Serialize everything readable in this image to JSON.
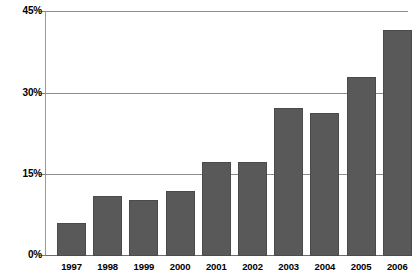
{
  "chart_data": {
    "type": "bar",
    "title": "",
    "xlabel": "",
    "ylabel": "",
    "categories": [
      "1997",
      "1998",
      "1999",
      "2000",
      "2001",
      "2002",
      "2003",
      "2004",
      "2005",
      "2006"
    ],
    "values": [
      6.1,
      11.1,
      10.2,
      12.0,
      17.2,
      17.2,
      27.2,
      26.3,
      32.8,
      41.5
    ],
    "value_labels": [
      "",
      "",
      "",
      "",
      "",
      "",
      "",
      "",
      "",
      ""
    ],
    "ylim": [
      0,
      45
    ],
    "yticks": [
      0,
      15,
      30,
      45
    ],
    "ytick_labels": [
      "0%",
      "15%",
      "30%",
      "45%"
    ],
    "grid": true,
    "grid_axis": "y",
    "legend": false,
    "legend_position": "none",
    "series": [
      {
        "name": "",
        "values": [
          6.1,
          11.1,
          10.2,
          12.0,
          17.2,
          17.2,
          27.2,
          26.3,
          32.8,
          41.5
        ],
        "color": "#595959"
      }
    ]
  },
  "style": {
    "bar_color": "#595959",
    "bar_border_color": "#4a4a4a",
    "gridline_color": "#8c8c8c",
    "axis_color": "#9a9a9a",
    "background": "#ffffff",
    "text_color": "#000000"
  }
}
